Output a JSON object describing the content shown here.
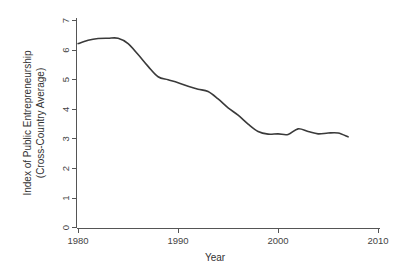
{
  "chart_data": {
    "type": "line",
    "title": "",
    "xlabel": "Year",
    "ylabel": "Index of Public Entrepreneurship (Cross-Country Average)",
    "ylabel_line1": "Index of Public Entrepreneurship",
    "ylabel_line2": "(Cross-Country Average)",
    "xlim": [
      1979,
      2010
    ],
    "ylim": [
      0,
      7
    ],
    "xticks": [
      1980,
      1990,
      2000,
      2010
    ],
    "xtick_labels": [
      "1980",
      "1990",
      "2000",
      "2010"
    ],
    "yticks": [
      0,
      1,
      2,
      3,
      4,
      5,
      6,
      7
    ],
    "ytick_labels": [
      "0",
      "1",
      "2",
      "3",
      "4",
      "5",
      "6",
      "7"
    ],
    "grid": false,
    "legend": false,
    "legend_position": "none",
    "line_color": "#3a3a3a",
    "axis_color": "#555555",
    "background_color": "#ffffff",
    "series": [
      {
        "name": "Index of Public Entrepreneurship",
        "x": [
          1980,
          1981,
          1982,
          1983,
          1984,
          1985,
          1986,
          1987,
          1988,
          1989,
          1990,
          1991,
          1992,
          1993,
          1994,
          1995,
          1996,
          1997,
          1998,
          1999,
          2000,
          2001,
          2002,
          2003,
          2004,
          2005,
          2006,
          2007
        ],
        "values": [
          6.22,
          6.33,
          6.39,
          6.4,
          6.4,
          6.22,
          5.85,
          5.45,
          5.1,
          5.0,
          4.9,
          4.78,
          4.68,
          4.6,
          4.35,
          4.05,
          3.8,
          3.5,
          3.25,
          3.16,
          3.17,
          3.15,
          3.34,
          3.25,
          3.17,
          3.2,
          3.2,
          3.07
        ]
      }
    ]
  },
  "axes": {
    "x_axis_name": "year-axis",
    "y_axis_name": "index-axis"
  }
}
